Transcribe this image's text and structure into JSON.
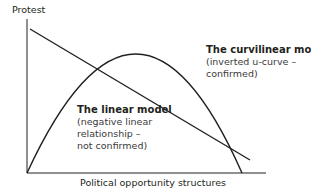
{
  "diagram": {
    "y_axis_label": "Protest",
    "x_axis_label": "Political opportunity structures",
    "curvilinear": {
      "title": "The curvilinear model",
      "lines": [
        "(inverted u-curve –",
        "confirmed)"
      ]
    },
    "linear": {
      "title": "The linear model",
      "lines": [
        "(negative linear",
        "relationship –",
        "not confirmed)"
      ]
    },
    "colors": {
      "lines": "#231f20",
      "background": "#ffffff"
    }
  }
}
